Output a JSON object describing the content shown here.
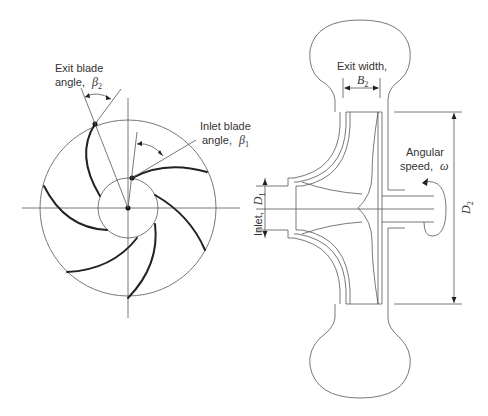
{
  "diagram": {
    "type": "centrifugal-pump-impeller",
    "left_view": {
      "name": "impeller-front-view",
      "labels": {
        "exit_blade_angle_line1": "Exit blade",
        "exit_blade_angle_line2": "angle,",
        "exit_blade_angle_symbol": "β",
        "exit_blade_angle_sub": "2",
        "inlet_blade_angle_line1": "Inlet blade",
        "inlet_blade_angle_line2": "angle,",
        "inlet_blade_angle_symbol": "β",
        "inlet_blade_angle_sub": "1"
      },
      "blade_count": 6
    },
    "right_view": {
      "name": "impeller-side-section",
      "labels": {
        "exit_width_line1": "Exit width,",
        "exit_width_symbol": "B",
        "exit_width_sub": "2",
        "inlet_text": "Inlet,",
        "inlet_symbol": "D",
        "inlet_sub": "1",
        "angular_speed_line1": "Angular",
        "angular_speed_line2": "speed,",
        "angular_speed_symbol": "ω",
        "outer_diameter_symbol": "D",
        "outer_diameter_sub": "2"
      }
    }
  }
}
